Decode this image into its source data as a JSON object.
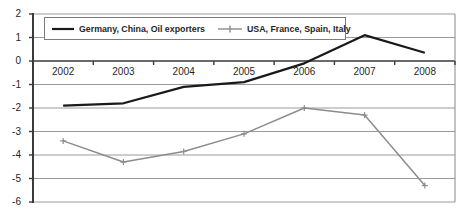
{
  "chart_data": {
    "type": "line",
    "title": "",
    "categories": [
      "2002",
      "2003",
      "2004",
      "2005",
      "2006",
      "2007",
      "2008"
    ],
    "series": [
      {
        "name": "Germany, China, Oil exporters",
        "color": "#1a1a1a",
        "marker": "none",
        "values": [
          -1.9,
          -1.8,
          -1.1,
          -0.9,
          -0.1,
          1.1,
          0.35
        ]
      },
      {
        "name": "USA, France, Spain, Italy",
        "color": "#8c8c8c",
        "marker": "plus",
        "values": [
          -3.4,
          -4.3,
          -3.85,
          -3.1,
          -2.0,
          -2.3,
          -5.3
        ]
      }
    ],
    "y_ticks": [
      2,
      1,
      0,
      -1,
      -2,
      -3,
      -4,
      -5,
      -6
    ],
    "ylim": [
      -6,
      2
    ],
    "grid": true,
    "legend_position": "top",
    "xlabel": "",
    "ylabel": ""
  },
  "colors": {
    "gridline": "#9a9a9a",
    "axis": "#3a3a3a",
    "background": "#ffffff",
    "legend_border": "#7d7d7d",
    "label_text": "#1f1f1f"
  }
}
